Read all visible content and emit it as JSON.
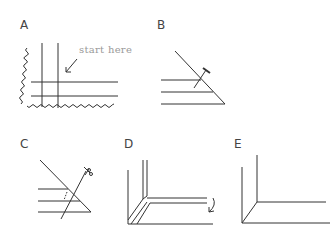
{
  "figure": {
    "panels": [
      {
        "id": "A",
        "label": "A",
        "annotation": "start here"
      },
      {
        "id": "B",
        "label": "B"
      },
      {
        "id": "C",
        "label": "C"
      },
      {
        "id": "D",
        "label": "D"
      },
      {
        "id": "E",
        "label": "E"
      }
    ],
    "stroke_color": "#333333",
    "annotation_color": "#9a9a9a"
  }
}
